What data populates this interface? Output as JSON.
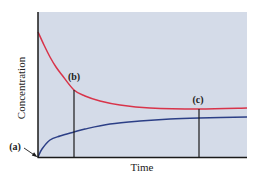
{
  "chart_data": {
    "type": "line",
    "title": "",
    "xlabel": "Time",
    "ylabel": "Concentration",
    "grid": false,
    "legend": null,
    "axis_ticks": "none (qualitative axes)",
    "series": [
      {
        "name": "reactant",
        "color": "#d8344a",
        "description": "decreasing concentration approaching equilibrium plateau",
        "points_px": [
          [
            38,
            32
          ],
          [
            44,
            45
          ],
          [
            50,
            57
          ],
          [
            56,
            67
          ],
          [
            62,
            75
          ],
          [
            74,
            90
          ],
          [
            85,
            96
          ],
          [
            100,
            101
          ],
          [
            120,
            105
          ],
          [
            150,
            108
          ],
          [
            199,
            109
          ],
          [
            247,
            108
          ]
        ]
      },
      {
        "name": "product",
        "color": "#2c3f86",
        "description": "increasing concentration from zero approaching equilibrium plateau",
        "points_px": [
          [
            38,
            157
          ],
          [
            42,
            149
          ],
          [
            50,
            140
          ],
          [
            60,
            136
          ],
          [
            74,
            132
          ],
          [
            85,
            129
          ],
          [
            110,
            124
          ],
          [
            140,
            121
          ],
          [
            170,
            119
          ],
          [
            199,
            118
          ],
          [
            247,
            117
          ]
        ]
      }
    ],
    "annotations": [
      {
        "label": "(a)",
        "meaning": "start, product concentration zero",
        "arrow_from_px": [
          24,
          148
        ],
        "arrow_to_px": [
          37,
          157
        ]
      },
      {
        "label": "(b)",
        "meaning": "intermediate time vertical marker",
        "x_px": 74,
        "y_top_px": 90
      },
      {
        "label": "(c)",
        "meaning": "equilibrium reached vertical marker",
        "x_px": 199,
        "y_top_px": 109
      }
    ],
    "plot_area_px": {
      "left": 38,
      "top": 12,
      "right": 247,
      "bottom": 157
    },
    "colors": {
      "plot_background": "#d4dbe8",
      "axis": "#1a1a1a",
      "marker_lines": "#1a1a1a"
    }
  },
  "labels": {
    "x_axis": "Time",
    "y_axis": "Concentration",
    "a": "(a)",
    "b": "(b)",
    "c": "(c)"
  }
}
